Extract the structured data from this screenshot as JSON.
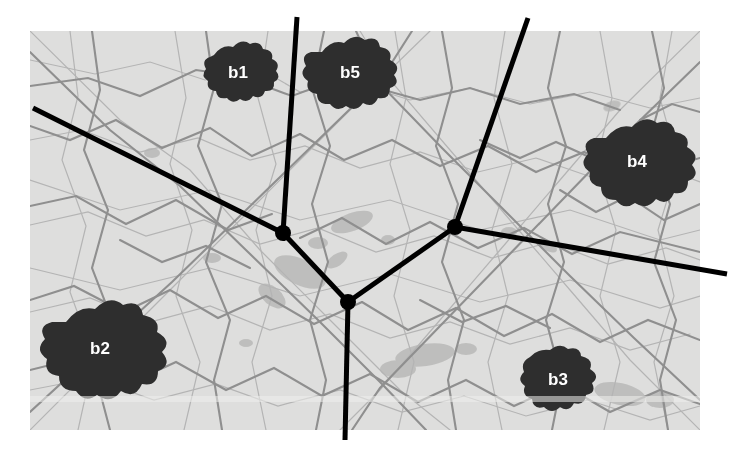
{
  "figure": {
    "kind": "raster-map-with-network-overlay",
    "width": 729,
    "height": 455,
    "background_color": "#ffffff"
  },
  "map": {
    "name": "grayscale-region-map",
    "x": 30,
    "y": 31,
    "width": 670,
    "height": 399,
    "base_color": "#dededd",
    "paper_color": "#e8e8e7",
    "road_color": "#8f8f8f",
    "minor_road_color": "#b4b4b4",
    "urban_patch_color": "#b0b0b0"
  },
  "cities": [
    {
      "id": "b1",
      "label": "b1",
      "cx": 238,
      "cy": 73,
      "size": 52,
      "shape_seed": 1
    },
    {
      "id": "b2",
      "label": "b2",
      "cx": 100,
      "cy": 348,
      "size": 74,
      "shape_seed": 2
    },
    {
      "id": "b3",
      "label": "b3",
      "cx": 556,
      "cy": 381,
      "size": 56,
      "shape_seed": 3
    },
    {
      "id": "b4",
      "label": "b4",
      "cx": 637,
      "cy": 162,
      "size": 66,
      "shape_seed": 4
    },
    {
      "id": "b5",
      "label": "b5",
      "cx": 349,
      "cy": 74,
      "size": 58,
      "shape_seed": 5
    }
  ],
  "network": {
    "color": "#000000",
    "edge_width": 5,
    "node_radius": 8,
    "nodes": [
      {
        "id": "n1",
        "x": 283,
        "y": 233
      },
      {
        "id": "n2",
        "x": 348,
        "y": 302
      },
      {
        "id": "n3",
        "x": 455,
        "y": 227
      }
    ],
    "edges": [
      {
        "id": "e-n1-n2",
        "from": "n1",
        "to": "n2",
        "x1": 283,
        "y1": 233,
        "x2": 348,
        "y2": 302
      },
      {
        "id": "e-n2-n3",
        "from": "n2",
        "to": "n3",
        "x1": 348,
        "y1": 302,
        "x2": 455,
        "y2": 227
      },
      {
        "id": "e-n1-top",
        "from": "n1",
        "to": "top-border",
        "x1": 283,
        "y1": 233,
        "x2": 297,
        "y2": 17
      },
      {
        "id": "e-n1-left",
        "from": "n1",
        "to": "left-border",
        "x1": 283,
        "y1": 233,
        "x2": 33,
        "y2": 108
      },
      {
        "id": "e-n2-bottom",
        "from": "n2",
        "to": "bottom-border",
        "x1": 348,
        "y1": 302,
        "x2": 345,
        "y2": 440
      },
      {
        "id": "e-n3-top",
        "from": "n3",
        "to": "top-border",
        "x1": 455,
        "y1": 227,
        "x2": 528,
        "y2": 18
      },
      {
        "id": "e-n3-right",
        "from": "n3",
        "to": "right-border",
        "x1": 455,
        "y1": 227,
        "x2": 727,
        "y2": 274
      }
    ]
  },
  "labels": {
    "font_size": 17,
    "color": "#ffffff"
  }
}
